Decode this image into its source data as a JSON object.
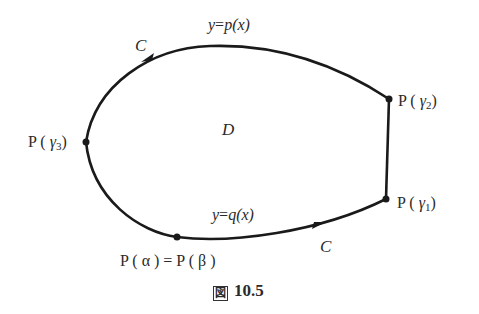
{
  "figure": {
    "caption_prefix": "図",
    "caption_number": "10.5",
    "region_label": "D",
    "curve_label_top": "C",
    "curve_label_bottom": "C",
    "upper_function": {
      "y": "y",
      "eq": "=",
      "f": "p",
      "arg": "(x)"
    },
    "lower_function": {
      "y": "y",
      "eq": "=",
      "f": "q",
      "arg": "(x)"
    },
    "points": {
      "gamma2": {
        "P": "P",
        "open": " ( ",
        "sym": "γ",
        "sub": "2",
        "close": ")"
      },
      "gamma1": {
        "P": "P",
        "open": " ( ",
        "sym": "γ",
        "sub": "1",
        "close": ")"
      },
      "gamma3": {
        "P": "P",
        "open": " ( ",
        "sym": "γ",
        "sub": "3",
        "close": ")"
      },
      "alpha_beta": {
        "text": "P ( α ) = P ( β )"
      }
    },
    "colors": {
      "stroke": "#1a1a1a",
      "text": "#2a2a2a"
    }
  }
}
